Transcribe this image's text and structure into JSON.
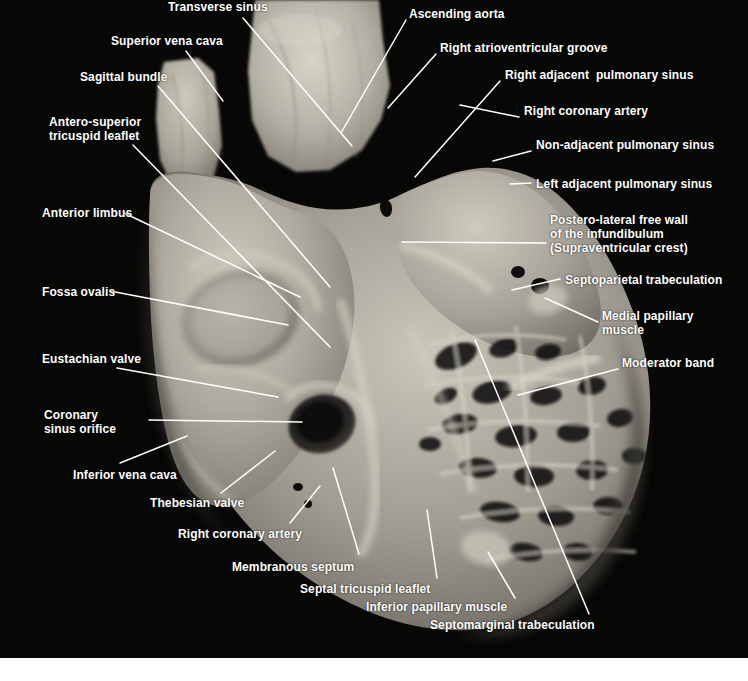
{
  "figure": {
    "kind": "anatomical-photograph",
    "background_color": "#050505",
    "label_color": "#ffffff",
    "leader_color": "#ffffff",
    "margin_color": "#ffffff",
    "photo_width": 748,
    "photo_height": 658
  },
  "labels": [
    {
      "id": "transverse-sinus",
      "text": "Transverse sinus",
      "x": 168,
      "y": 0,
      "align": "left",
      "leader": [
        [
          243,
          18
        ],
        [
          352,
          146
        ]
      ]
    },
    {
      "id": "superior-vena-cava",
      "text": "Superior vena cava",
      "x": 111,
      "y": 34,
      "align": "left",
      "leader": [
        [
          186,
          51
        ],
        [
          223,
          101
        ]
      ]
    },
    {
      "id": "sagittal-bundle",
      "text": "Sagittal bundle",
      "x": 80,
      "y": 70,
      "align": "left",
      "leader": [
        [
          158,
          86
        ],
        [
          330,
          287
        ]
      ]
    },
    {
      "id": "antero-superior-tricuspid-leaflet",
      "text": "Antero-superior\ntricuspid leaflet",
      "x": 49,
      "y": 115,
      "align": "left",
      "leader": [
        [
          133,
          145
        ],
        [
          330,
          347
        ]
      ]
    },
    {
      "id": "anterior-limbus",
      "text": "Anterior limbus",
      "x": 42,
      "y": 206,
      "align": "left",
      "leader": [
        [
          124,
          213
        ],
        [
          300,
          297
        ]
      ]
    },
    {
      "id": "fossa-ovalis",
      "text": "Fossa ovalis",
      "x": 42,
      "y": 285,
      "align": "left",
      "leader": [
        [
          110,
          291
        ],
        [
          288,
          325
        ]
      ]
    },
    {
      "id": "eustachian-valve",
      "text": "Eustachian valve",
      "x": 42,
      "y": 352,
      "align": "left",
      "leader": [
        [
          117,
          368
        ],
        [
          278,
          397
        ]
      ]
    },
    {
      "id": "coronary-sinus-orifice",
      "text": "Coronary\nsinus orifice",
      "x": 44,
      "y": 408,
      "align": "left",
      "leader": [
        [
          149,
          420
        ],
        [
          302,
          422
        ]
      ]
    },
    {
      "id": "inferior-vena-cava",
      "text": "Inferior vena cava",
      "x": 73,
      "y": 468,
      "align": "left",
      "leader": [
        [
          120,
          463
        ],
        [
          187,
          436
        ]
      ]
    },
    {
      "id": "thebesian-valve",
      "text": "Thebesian valve",
      "x": 150,
      "y": 496,
      "align": "left",
      "leader": [
        [
          221,
          493
        ],
        [
          275,
          451
        ]
      ]
    },
    {
      "id": "right-coronary-artery-left",
      "text": "Right coronary artery",
      "x": 178,
      "y": 527,
      "align": "left",
      "leader": [
        [
          290,
          523
        ],
        [
          320,
          486
        ]
      ]
    },
    {
      "id": "membranous-septum",
      "text": "Membranous septum",
      "x": 232,
      "y": 560,
      "align": "left",
      "leader": [
        [
          359,
          554
        ],
        [
          333,
          468
        ]
      ]
    },
    {
      "id": "septal-tricuspid-leaflet",
      "text": "Septal tricuspid leaflet",
      "x": 300,
      "y": 582,
      "align": "left",
      "leader": [
        [
          437,
          578
        ],
        [
          427,
          510
        ]
      ]
    },
    {
      "id": "inferior-papillary-muscle",
      "text": "Inferior papillary muscle",
      "x": 366,
      "y": 600,
      "align": "left",
      "leader": [
        [
          515,
          598
        ],
        [
          488,
          552
        ]
      ]
    },
    {
      "id": "septomarginal-trabeculation",
      "text": "Septomarginal trabeculation",
      "x": 430,
      "y": 618,
      "align": "left",
      "leader": [
        [
          589,
          614
        ],
        [
          475,
          340
        ]
      ]
    },
    {
      "id": "ascending-aorta",
      "text": "Ascending aorta",
      "x": 409,
      "y": 7,
      "align": "left",
      "leader": [
        [
          406,
          20
        ],
        [
          341,
          133
        ]
      ]
    },
    {
      "id": "right-atrioventricular-groove",
      "text": "Right atrioventricular groove",
      "x": 440,
      "y": 41,
      "align": "left",
      "leader": [
        [
          436,
          54
        ],
        [
          388,
          108
        ]
      ]
    },
    {
      "id": "right-adjacent-pulmonary-sinus",
      "text": "Right adjacent  pulmonary sinus",
      "x": 505,
      "y": 68,
      "align": "left",
      "leader": [
        [
          500,
          81
        ],
        [
          415,
          177
        ]
      ]
    },
    {
      "id": "right-coronary-artery-right",
      "text": "Right coronary artery",
      "x": 524,
      "y": 104,
      "align": "left",
      "leader": [
        [
          519,
          117
        ],
        [
          460,
          105
        ]
      ]
    },
    {
      "id": "non-adjacent-pulmonary-sinus",
      "text": "Non-adjacent pulmonary sinus",
      "x": 536,
      "y": 138,
      "align": "left",
      "leader": [
        [
          531,
          151
        ],
        [
          493,
          161
        ]
      ]
    },
    {
      "id": "left-adjacent-pulmonary-sinus",
      "text": "Left adjacent pulmonary sinus",
      "x": 536,
      "y": 177,
      "align": "left",
      "leader": [
        [
          531,
          183
        ],
        [
          510,
          184
        ]
      ]
    },
    {
      "id": "postero-lateral-free-wall",
      "text": "Postero-lateral free wall\nof the infundibulum\n(Supraventricular crest)",
      "x": 550,
      "y": 213,
      "align": "left",
      "leader": [
        [
          546,
          243
        ],
        [
          402,
          242
        ]
      ]
    },
    {
      "id": "septoparietal-trabeculation",
      "text": "Septoparietal trabeculation",
      "x": 565,
      "y": 273,
      "align": "left",
      "leader": [
        [
          560,
          279
        ],
        [
          512,
          290
        ]
      ]
    },
    {
      "id": "medial-papillary-muscle",
      "text": "Medial papillary\nmuscle",
      "x": 602,
      "y": 309,
      "align": "left",
      "leader": [
        [
          598,
          322
        ],
        [
          545,
          298
        ]
      ]
    },
    {
      "id": "moderator-band",
      "text": "Moderator band",
      "x": 622,
      "y": 356,
      "align": "left",
      "leader": [
        [
          618,
          369
        ],
        [
          518,
          395
        ]
      ]
    }
  ],
  "specimen": {
    "description": "Formalin-fixed human heart, right chambers opened; greyscale tissue tones",
    "tone_highlight": "#d6d2c6",
    "tone_mid": "#a9a49a",
    "tone_shadow": "#6e6a62",
    "tone_dark": "#2a2824"
  }
}
